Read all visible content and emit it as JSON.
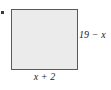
{
  "figure": {
    "type": "geometry-diagram",
    "shape": "rectangle",
    "bullet": "•",
    "labels": {
      "height": "19 − x",
      "width": "x + 2"
    },
    "colors": {
      "shape_fill": "#ebebeb",
      "shape_border": "#5a5a5a",
      "text": "#1a1a1a",
      "background": "#ffffff",
      "bullet": "#3a3a3a"
    }
  }
}
